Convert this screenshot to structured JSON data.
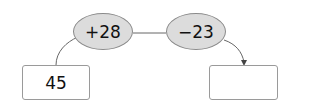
{
  "diagram": {
    "start_value": "45",
    "operations": [
      "+28",
      "−23"
    ],
    "result_value": "",
    "colors": {
      "ellipse_fill": "#dcdcdc",
      "stroke": "#666666"
    }
  }
}
